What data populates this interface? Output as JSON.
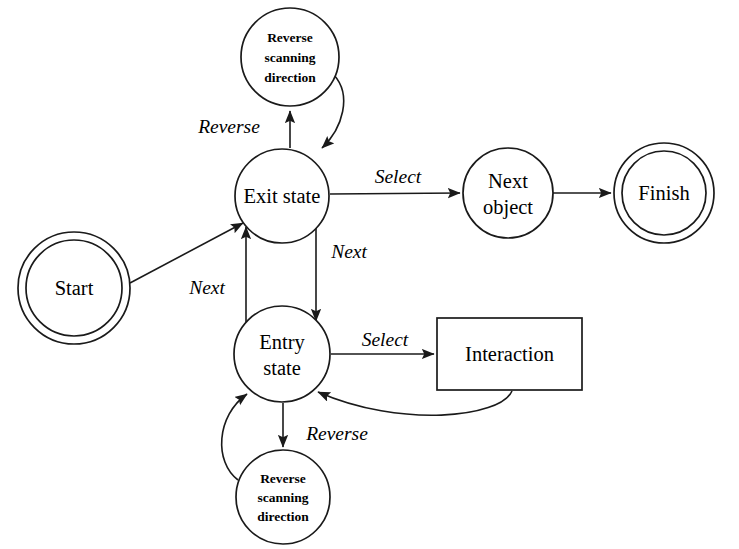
{
  "diagram": {
    "type": "state-diagram",
    "colors": {
      "stroke": "#1a1a1a",
      "fill": "#ffffff",
      "text": "#000000",
      "background": "#ffffff"
    },
    "nodes": [
      {
        "id": "start",
        "label": "Start",
        "shape": "double-circle",
        "cx": 74,
        "cy": 288,
        "r": 56,
        "r_inner": 48,
        "label_lines": [
          "Start"
        ],
        "style": "regular"
      },
      {
        "id": "reverse-scanning-top",
        "label": "Reverse scanning direction",
        "shape": "circle",
        "cx": 290,
        "cy": 57,
        "r": 49,
        "label_lines": [
          "Reverse",
          "scanning",
          "direction"
        ],
        "style": "bold"
      },
      {
        "id": "exit-state",
        "label": "Exit state",
        "shape": "circle",
        "cx": 282,
        "cy": 196,
        "r": 47,
        "label_lines": [
          "Exit state"
        ],
        "style": "regular"
      },
      {
        "id": "next-object",
        "label": "Next object",
        "shape": "circle",
        "cx": 508,
        "cy": 193,
        "r": 45,
        "label_lines": [
          "Next",
          "object"
        ],
        "style": "regular"
      },
      {
        "id": "finish",
        "label": "Finish",
        "shape": "double-circle",
        "cx": 664,
        "cy": 193,
        "r": 50,
        "r_inner": 42,
        "label_lines": [
          "Finish"
        ],
        "style": "regular"
      },
      {
        "id": "entry-state",
        "label": "Entry state",
        "shape": "circle",
        "cx": 282,
        "cy": 354,
        "r": 48,
        "label_lines": [
          "Entry",
          "state"
        ],
        "style": "regular"
      },
      {
        "id": "interaction",
        "label": "Interaction",
        "shape": "rectangle",
        "x": 437,
        "y": 318,
        "w": 145,
        "h": 72,
        "label_lines": [
          "Interaction"
        ],
        "style": "regular"
      },
      {
        "id": "reverse-scanning-bottom",
        "label": "Reverse scanning direction",
        "shape": "circle",
        "cx": 283,
        "cy": 497,
        "r": 47,
        "label_lines": [
          "Reverse",
          "scanning",
          "direction"
        ],
        "style": "bold"
      }
    ],
    "edges": [
      {
        "id": "start-to-exit",
        "from": "start",
        "to": "exit-state",
        "label": "",
        "kind": "straight"
      },
      {
        "id": "exit-to-reverse-top",
        "from": "exit-state",
        "to": "reverse-scanning-top",
        "label": "Reverse",
        "kind": "straight"
      },
      {
        "id": "reverse-top-to-exit",
        "from": "reverse-scanning-top",
        "to": "exit-state",
        "label": "",
        "kind": "curve"
      },
      {
        "id": "exit-to-next-object",
        "from": "exit-state",
        "to": "next-object",
        "label": "Select",
        "kind": "straight"
      },
      {
        "id": "next-object-to-finish",
        "from": "next-object",
        "to": "finish",
        "label": "",
        "kind": "straight"
      },
      {
        "id": "entry-to-exit",
        "from": "entry-state",
        "to": "exit-state",
        "label": "Next",
        "kind": "straight"
      },
      {
        "id": "exit-to-entry",
        "from": "exit-state",
        "to": "entry-state",
        "label": "Next",
        "kind": "straight"
      },
      {
        "id": "entry-to-interaction",
        "from": "entry-state",
        "to": "interaction",
        "label": "Select",
        "kind": "straight"
      },
      {
        "id": "interaction-to-entry",
        "from": "interaction",
        "to": "entry-state",
        "label": "Reverse",
        "kind": "curve"
      },
      {
        "id": "entry-to-reverse-bottom",
        "from": "entry-state",
        "to": "reverse-scanning-bottom",
        "label": "",
        "kind": "straight"
      },
      {
        "id": "reverse-bottom-to-entry",
        "from": "reverse-scanning-bottom",
        "to": "entry-state",
        "label": "",
        "kind": "curve"
      }
    ],
    "edge_labels": [
      {
        "id": "label-reverse-top",
        "text": "Reverse",
        "x": 229,
        "y": 129
      },
      {
        "id": "label-select-top",
        "text": "Select",
        "x": 398,
        "y": 179
      },
      {
        "id": "label-next-left",
        "text": "Next",
        "x": 207,
        "y": 290
      },
      {
        "id": "label-next-right",
        "text": "Next",
        "x": 349,
        "y": 254
      },
      {
        "id": "label-select-bottom",
        "text": "Select",
        "x": 385,
        "y": 342
      },
      {
        "id": "label-reverse-bottom",
        "text": "Reverse",
        "x": 337,
        "y": 436
      }
    ]
  }
}
